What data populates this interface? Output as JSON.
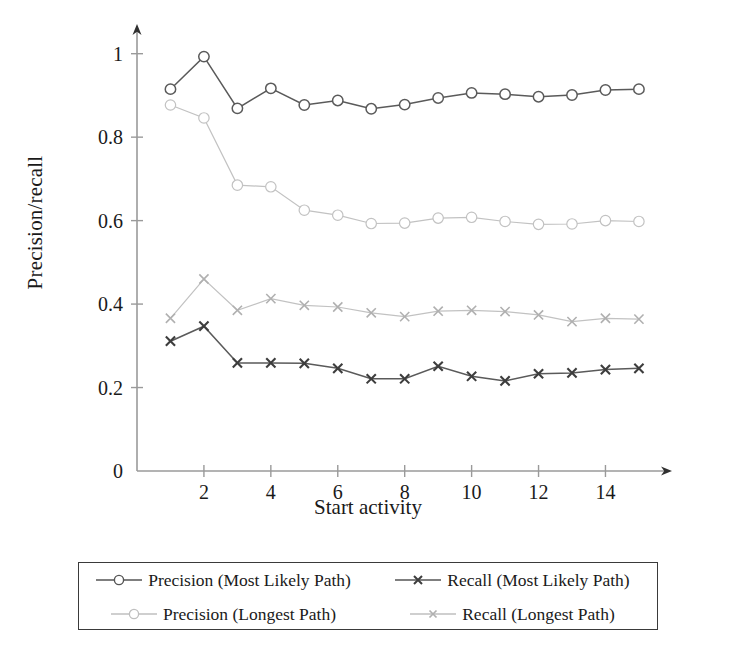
{
  "chart_data": {
    "type": "line",
    "title": "",
    "xlabel": "Start activity",
    "ylabel": "Precision/recall",
    "xlim": [
      0,
      15.6
    ],
    "ylim": [
      0,
      1.04
    ],
    "xticks": [
      2,
      4,
      6,
      8,
      10,
      12,
      14
    ],
    "yticks": [
      0,
      0.2,
      0.4,
      0.6,
      0.8,
      1
    ],
    "ytick_labels": [
      "0",
      "0.2",
      "0.4",
      "0.6",
      "0.8",
      "1"
    ],
    "xtick_labels": [
      "2",
      "4",
      "6",
      "8",
      "10",
      "12",
      "14"
    ],
    "grid": false,
    "legend_position": "below-axes",
    "x": [
      1,
      2,
      3,
      4,
      5,
      6,
      7,
      8,
      9,
      10,
      11,
      12,
      13,
      14,
      15
    ],
    "series": [
      {
        "name": "Precision (Most Likely Path)",
        "marker": "circle",
        "color": "#555555",
        "values": [
          0.915,
          0.993,
          0.869,
          0.917,
          0.877,
          0.888,
          0.868,
          0.878,
          0.894,
          0.906,
          0.903,
          0.897,
          0.901,
          0.913,
          0.915
        ]
      },
      {
        "name": "Recall (Most Likely Path)",
        "marker": "cross",
        "color": "#555555",
        "values": [
          0.311,
          0.347,
          0.259,
          0.259,
          0.258,
          0.246,
          0.221,
          0.221,
          0.251,
          0.227,
          0.216,
          0.233,
          0.235,
          0.243,
          0.246
        ]
      },
      {
        "name": "Precision (Longest Path)",
        "marker": "circle",
        "color": "#b5b5b5",
        "values": [
          0.877,
          0.846,
          0.685,
          0.681,
          0.625,
          0.613,
          0.593,
          0.594,
          0.606,
          0.608,
          0.598,
          0.591,
          0.592,
          0.6,
          0.598
        ]
      },
      {
        "name": "Recall (Longest Path)",
        "marker": "cross",
        "color": "#b5b5b5",
        "values": [
          0.366,
          0.46,
          0.385,
          0.413,
          0.397,
          0.393,
          0.379,
          0.37,
          0.383,
          0.385,
          0.382,
          0.374,
          0.358,
          0.366,
          0.364
        ]
      }
    ]
  },
  "legend": {
    "entries": [
      {
        "label": "Precision (Most Likely Path)",
        "marker": "circle",
        "color": "#555555"
      },
      {
        "label": "Recall (Most Likely Path)",
        "marker": "cross",
        "color": "#555555"
      },
      {
        "label": "Precision (Longest Path)",
        "marker": "circle",
        "color": "#b5b5b5"
      },
      {
        "label": "Recall (Longest Path)",
        "marker": "cross",
        "color": "#b5b5b5"
      }
    ]
  }
}
